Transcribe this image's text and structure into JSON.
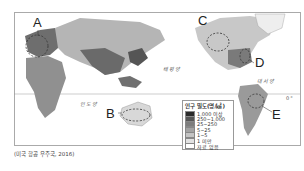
{
  "labels": {
    "A": "A",
    "B": "B",
    "C": "C",
    "D": "D",
    "E": "E"
  },
  "oceans": {
    "pacific": "태평양",
    "atlantic": "대서양",
    "indian": "인도양"
  },
  "legend": {
    "title": "인구 밀도(명/㎢)",
    "items": [
      {
        "label": "1,000 이상",
        "color": "#2a2a2a"
      },
      {
        "label": "250~1,000",
        "color": "#555555"
      },
      {
        "label": "25~250",
        "color": "#7d7d7d"
      },
      {
        "label": "5~25",
        "color": "#a3a3a3"
      },
      {
        "label": "1~5",
        "color": "#c4c4c4"
      },
      {
        "label": "1 미만",
        "color": "#e2e2e2"
      },
      {
        "label": "자료 없음",
        "color": "#ffffff"
      }
    ]
  },
  "source": "(미국 항공 우주국, 2016)",
  "equator_mark": "0°"
}
